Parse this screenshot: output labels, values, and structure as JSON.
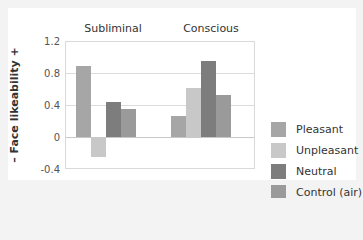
{
  "chart_data": {
    "type": "bar",
    "title": "",
    "categories": [
      "Subliminal",
      "Conscious"
    ],
    "series": [
      {
        "name": "Pleasant",
        "color": "#a6a6a6",
        "values": [
          0.89,
          0.26
        ]
      },
      {
        "name": "Unpleasant",
        "color": "#c8c8c8",
        "values": [
          -0.24,
          0.61
        ]
      },
      {
        "name": "Neutral",
        "color": "#7d7d7d",
        "values": [
          0.44,
          0.95
        ]
      },
      {
        "name": "Control (air)",
        "color": "#9a9a9a",
        "values": [
          0.35,
          0.52
        ]
      }
    ],
    "xlabel": "",
    "ylabel": "–  Face likeability  +",
    "ylim": [
      -0.4,
      1.2
    ],
    "yticks": [
      "1.2",
      "0.8",
      "0.4",
      "0",
      "-0.4"
    ],
    "grid": true,
    "legend_position": "right"
  }
}
